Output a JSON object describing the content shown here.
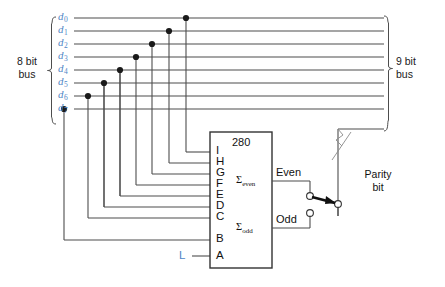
{
  "diagram": {
    "left_bus": {
      "label_line1": "8 bit",
      "label_line2": "bus",
      "bit_count": 8
    },
    "right_bus": {
      "label_line1": "9 bit",
      "label_line2": "bus",
      "bit_count": 9
    },
    "data_lines": [
      {
        "name": "d",
        "index": "0"
      },
      {
        "name": "d",
        "index": "1"
      },
      {
        "name": "d",
        "index": "2"
      },
      {
        "name": "d",
        "index": "3"
      },
      {
        "name": "d",
        "index": "4"
      },
      {
        "name": "d",
        "index": "5"
      },
      {
        "name": "d",
        "index": "6"
      },
      {
        "name": "d",
        "index": "7"
      }
    ],
    "chip": {
      "part_number": "280",
      "pins": [
        "I",
        "H",
        "G",
        "F",
        "E",
        "D",
        "C",
        "B",
        "A"
      ],
      "outputs": [
        {
          "sigma": "Σ",
          "sub": "even",
          "signal": "Even"
        },
        {
          "sigma": "Σ",
          "sub": "odd",
          "signal": "Odd"
        }
      ],
      "control_input": "L"
    },
    "parity": {
      "label_line1": "Parity",
      "label_line2": "bit"
    },
    "colors": {
      "wire": "#4d4d4d",
      "data_label": "#4f86c6",
      "text": "#111111",
      "chip_border": "#333333",
      "background": "#ffffff"
    }
  }
}
